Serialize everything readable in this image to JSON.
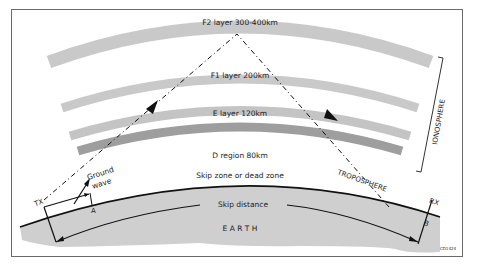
{
  "diagram": {
    "layers": [
      {
        "id": "f2",
        "label": "F2 layer 300-400km",
        "color": "#c9c9c9"
      },
      {
        "id": "f1",
        "label": "F1 layer 200km",
        "color": "#c9c9c9"
      },
      {
        "id": "e",
        "label": "E layer 120km",
        "color": "#c4c4c4"
      },
      {
        "id": "d",
        "label": "D region 80km",
        "color": "#9e9e9e"
      }
    ],
    "regions": {
      "ionosphere": "IONOSPHERE",
      "troposphere": "TROPOSPHERE",
      "earth": "E A R T H"
    },
    "labels": {
      "tx": "TX",
      "rx": "RX",
      "ground_wave": [
        "Ground",
        "wave"
      ],
      "point_a": "A",
      "point_b": "B",
      "skip_zone": "Skip zone or dead zone",
      "skip_distance": "Skip distance",
      "figure_code": "CD1424"
    },
    "colors": {
      "earth": "#cfcfcf",
      "frame": "#6a6a6a",
      "lines": "#111111"
    }
  }
}
